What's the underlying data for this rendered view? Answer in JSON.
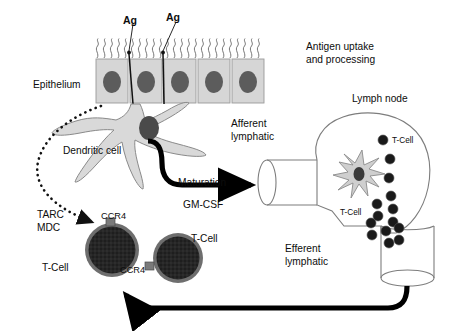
{
  "figure": {
    "type": "biological-pathway-diagram"
  },
  "colors": {
    "background": "#ffffff",
    "epithelium_fill": "#d6d6d6",
    "epithelium_stroke": "#9a9a9a",
    "nucleus_fill": "#5c5c5c",
    "dendritic_fill": "#d9d9d9",
    "dendritic_stroke": "#8a8a8a",
    "dendritic_nucleus": "#4a4a4a",
    "tcell_fill": "#2b2b2b",
    "tcell_stroke": "#6e6e6e",
    "tcell_dot": "#1a1a1a",
    "lymph_stroke": "#7d7d7d",
    "arrow_black": "#000000",
    "text": "#0d0d0d"
  },
  "labels": {
    "ag_left": "Ag",
    "ag_right": "Ag",
    "epithelium": "Epithelium",
    "antigen_uptake": "Antigen uptake",
    "and_processing": "and processing",
    "lymph_node": "Lymph node",
    "afferent": "Afferent",
    "afferent_2": "lymphatic",
    "efferent": "Efferent",
    "efferent_2": "lymphatic",
    "dendritic_cell": "Dendritic cell",
    "maturation": "Maturation",
    "gm_csf": "GM-CSF",
    "tarc": "TARC",
    "mdc": "MDC",
    "ccr4_top": "CCR4",
    "ccr4_bottom": "CCR4",
    "tcell_left": "T-Cell",
    "tcell_right": "T-Cell",
    "tcell_node_top": "T-Cell",
    "tcell_node_bottom": "T-Cell"
  },
  "structures": {
    "epithelial_cells": 5,
    "antigen_arrows": 2,
    "node_tcells": 14,
    "peripheral_tcells": 2,
    "receptors": [
      "CCR4",
      "CCR4"
    ]
  }
}
